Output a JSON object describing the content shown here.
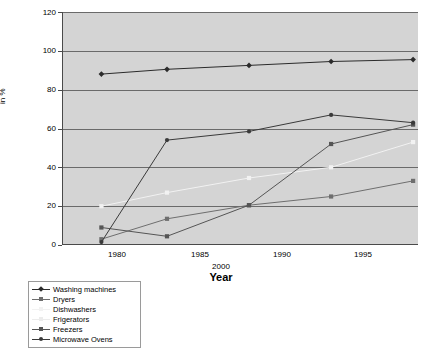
{
  "chart_data": {
    "type": "line",
    "title": "",
    "xlabel": "Year",
    "ylabel": "in %",
    "ylim": [
      0,
      120
    ],
    "ytick_step": 20,
    "yticks": [
      "0",
      "20",
      "40",
      "60",
      "80",
      "100",
      "120"
    ],
    "xticks": [
      "1980",
      "1985",
      "1990",
      "1995"
    ],
    "stray_xtick": "2000",
    "grid": true,
    "legend_position": "below-left",
    "x": [
      1978,
      1982,
      1987,
      1992,
      1997
    ],
    "series": [
      {
        "name": "Washing machines",
        "color": "#2b2b2b",
        "marker": "diamond",
        "values": [
          88,
          90.5,
          92.5,
          94.5,
          95.5
        ]
      },
      {
        "name": "Dryers",
        "color": "#6e6e6e",
        "marker": "square",
        "values": [
          3,
          13.5,
          20.5,
          25,
          33
        ]
      },
      {
        "name": "Dishwashers",
        "color": "#f2f2f2",
        "marker": "square",
        "values": [
          20,
          27,
          34.5,
          40,
          53
        ]
      },
      {
        "name": "Frigerators",
        "color": "#ececec",
        "marker": "square",
        "values": [
          null,
          null,
          null,
          null,
          null
        ]
      },
      {
        "name": "Freezers",
        "color": "#555555",
        "marker": "square",
        "values": [
          9,
          4.5,
          20.5,
          52,
          62
        ]
      },
      {
        "name": "Microwave Ovens",
        "color": "#3a3a3a",
        "marker": "circle",
        "values": [
          1.5,
          54,
          58.5,
          67,
          63
        ]
      }
    ]
  },
  "legend": {
    "items": [
      {
        "label": "Washing machines"
      },
      {
        "label": "Dryers"
      },
      {
        "label": "Dishwashers"
      },
      {
        "label": "Frigerators"
      },
      {
        "label": "Freezers"
      },
      {
        "label": "Microwave Ovens"
      }
    ]
  }
}
